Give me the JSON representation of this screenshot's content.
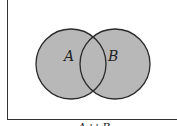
{
  "diagram": {
    "type": "venn",
    "sets": [
      {
        "label": "A",
        "shaded": true
      },
      {
        "label": "B",
        "shaded": true
      }
    ],
    "caption": "A ∪ B",
    "colors": {
      "fill": "#b8b8b8",
      "stroke": "#2a2a2a",
      "background": "#ffffff"
    }
  }
}
